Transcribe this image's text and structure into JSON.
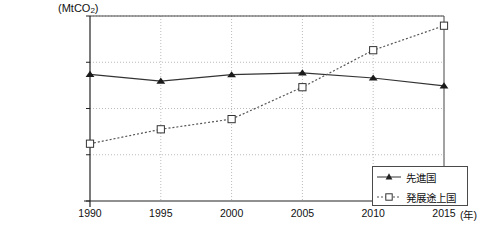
{
  "chart_data": {
    "type": "line",
    "title": "",
    "xlabel": "(年)",
    "ylabel": "(MtCO2)",
    "ylabel_main": "(MtCO",
    "ylabel_sub": "2",
    "ylabel_close": ")",
    "x": [
      1990,
      1995,
      2000,
      2005,
      2010,
      2015
    ],
    "xticklabels": [
      "1990",
      "1995",
      "2000",
      "2005",
      "2010",
      "2015"
    ],
    "yticklabels": [
      "0",
      "5000",
      "10000",
      "15000",
      "20000"
    ],
    "yticks": [
      0,
      5000,
      10000,
      15000,
      20000
    ],
    "ylim": [
      0,
      20000
    ],
    "xlim": [
      1990,
      2015
    ],
    "grid": true,
    "legend_position": "bottom-right-inside",
    "series": [
      {
        "name": "先進国",
        "marker": "filled-triangle",
        "linestyle": "solid",
        "color": "#333333",
        "values": [
          13700,
          12950,
          13650,
          13850,
          13300,
          12450
        ]
      },
      {
        "name": "発展途上国",
        "marker": "open-square",
        "linestyle": "dotted",
        "color": "#555555",
        "values": [
          6200,
          7750,
          8850,
          12300,
          16300,
          18950
        ]
      }
    ]
  },
  "legend": {
    "items": [
      {
        "label": "先進国"
      },
      {
        "label": "発展途上国"
      }
    ]
  },
  "colors": {
    "axis": "#444444",
    "grid": "#bbbbbb",
    "series_developed": "#333333",
    "series_developing": "#555555",
    "background": "#ffffff"
  }
}
